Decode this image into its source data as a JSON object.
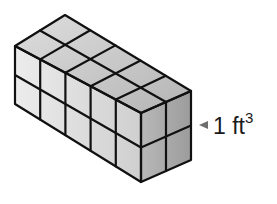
{
  "diagram": {
    "type": "isometric-rectangular-prism-of-unit-cubes",
    "dimensions": {
      "length": 5,
      "width": 2,
      "height": 2
    },
    "unit_cube_label": {
      "number": "1",
      "unit": "ft",
      "exponent": "3",
      "text": "1 ft³"
    },
    "colors": {
      "top_face": "#c8c8c8",
      "front_face": "#dcdcdc",
      "right_face": "#a9a9a9",
      "edges": "#111111",
      "arrow": "#6e6e6e"
    }
  }
}
